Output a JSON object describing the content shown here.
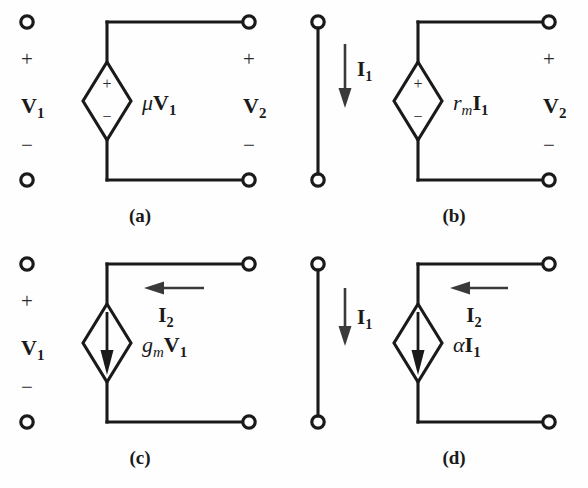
{
  "figure": {
    "background": "#fefefe",
    "ink": "#1a1a1a"
  },
  "panels": [
    {
      "id": "a",
      "caption": "(a)",
      "source_type": "voltage-controlled-voltage-source",
      "source_symbol": "diamond-plus-minus",
      "source_label": {
        "coefficient": "μ",
        "variable": "V",
        "subscript": "1"
      },
      "input_port": {
        "kind": "open",
        "plus": "+",
        "minus": "−",
        "label": {
          "variable": "V",
          "subscript": "1"
        }
      },
      "output_port": {
        "kind": "voltage",
        "plus": "+",
        "minus": "−",
        "label": {
          "variable": "V",
          "subscript": "2"
        }
      },
      "source_polarity": {
        "plus": "+",
        "minus": "−"
      },
      "current_arrow": null
    },
    {
      "id": "b",
      "caption": "(b)",
      "source_type": "current-controlled-voltage-source",
      "source_symbol": "diamond-plus-minus",
      "source_label": {
        "coefficient": "r",
        "coefficient_subscript": "m",
        "variable": "I",
        "subscript": "1"
      },
      "input_port": {
        "kind": "short",
        "current_label": {
          "variable": "I",
          "subscript": "1"
        },
        "current_direction": "down"
      },
      "output_port": {
        "kind": "voltage",
        "plus": "+",
        "minus": "−",
        "label": {
          "variable": "V",
          "subscript": "2"
        }
      },
      "source_polarity": {
        "plus": "+",
        "minus": "−"
      },
      "current_arrow": null
    },
    {
      "id": "c",
      "caption": "(c)",
      "source_type": "voltage-controlled-current-source",
      "source_symbol": "diamond-down-arrow",
      "source_label": {
        "coefficient": "g",
        "coefficient_subscript": "m",
        "variable": "V",
        "subscript": "1"
      },
      "input_port": {
        "kind": "open",
        "plus": "+",
        "minus": "−",
        "label": {
          "variable": "V",
          "subscript": "1"
        }
      },
      "output_port": {
        "kind": "current",
        "current_label": {
          "variable": "I",
          "subscript": "2"
        },
        "current_direction": "left"
      },
      "source_polarity": null,
      "current_arrow": "down"
    },
    {
      "id": "d",
      "caption": "(d)",
      "source_type": "current-controlled-current-source",
      "source_symbol": "diamond-down-arrow",
      "source_label": {
        "coefficient": "α",
        "variable": "I",
        "subscript": "1"
      },
      "input_port": {
        "kind": "short",
        "current_label": {
          "variable": "I",
          "subscript": "1"
        },
        "current_direction": "down"
      },
      "output_port": {
        "kind": "current",
        "current_label": {
          "variable": "I",
          "subscript": "2"
        },
        "current_direction": "left"
      },
      "source_polarity": null,
      "current_arrow": "down"
    }
  ]
}
